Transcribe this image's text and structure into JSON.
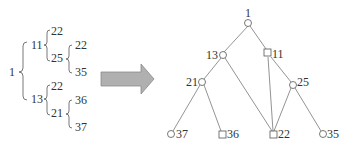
{
  "left_tree": {
    "root": "1",
    "n11": "11",
    "n11_a": "22",
    "n25": "25",
    "n25_a": "22",
    "n25_b": "35",
    "n13": "13",
    "n13_a": "22",
    "n21": "21",
    "n21_a": "36",
    "n21_b": "37"
  },
  "arrow": {
    "color": "#a9a9a9",
    "stroke": "#808080"
  },
  "graph": {
    "nodes": {
      "n1": "1",
      "n13": "13",
      "n11": "11",
      "n21": "21",
      "n25": "25",
      "n37": "37",
      "n36": "36",
      "n22": "22",
      "n35": "35"
    },
    "line_color": "#777777"
  }
}
